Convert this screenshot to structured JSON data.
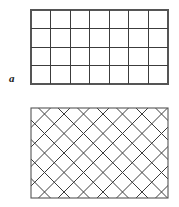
{
  "figure": {
    "background_color": "#ffffff",
    "line_color": "#3c3c3c",
    "border_color": "#555555",
    "width": 179,
    "height": 207
  },
  "panels": [
    {
      "id": "a",
      "label": "a",
      "pattern": "orthogonal-grid",
      "rect": {
        "x": 31,
        "y": 10,
        "width": 137,
        "height": 74
      },
      "columns": 7,
      "rows": 4,
      "line_color": "#3c3c3c",
      "border_color": "#555555",
      "border_width": 1.1,
      "line_width": 1.0,
      "fill": "#ffffff"
    },
    {
      "id": "b",
      "label": "b",
      "pattern": "diagonal-grid",
      "rect": {
        "x": 31,
        "y": 108,
        "width": 137,
        "height": 90
      },
      "angle_degrees": 45,
      "diagonal_spacing": 19.5,
      "line_color": "#3c3c3c",
      "border_color": "#555555",
      "border_width": 1.1,
      "line_width": 1.0,
      "fill": "#ffffff"
    }
  ],
  "labels": {
    "a": "a",
    "b": "b"
  }
}
